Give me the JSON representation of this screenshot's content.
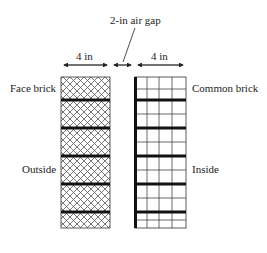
{
  "diagram": {
    "gap_label": "2-in air gap",
    "left_width_label": "4 in",
    "right_width_label": "4 in",
    "left_top_label": "Face brick",
    "left_mid_label": "Outside",
    "right_top_label": "Common brick",
    "right_mid_label": "Inside"
  },
  "layers": [
    {
      "name": "Face brick",
      "thickness": "4 in",
      "side": "Outside",
      "pattern": "crosshatch"
    },
    {
      "name": "Air gap",
      "thickness": "2 in"
    },
    {
      "name": "Common brick",
      "thickness": "4 in",
      "side": "Inside",
      "pattern": "grid"
    }
  ],
  "colors": {
    "line": "#1a1a1a",
    "hatch": "#555555",
    "background": "#ffffff"
  }
}
